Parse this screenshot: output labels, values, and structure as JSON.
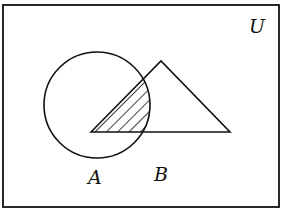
{
  "diagram": {
    "type": "venn",
    "universe_label": "U",
    "set_a": {
      "label": "A",
      "shape": "circle"
    },
    "set_b": {
      "label": "B",
      "shape": "triangle"
    },
    "shaded_region": "A ∩ B",
    "colors": {
      "stroke": "#111111",
      "background": "#ffffff"
    }
  }
}
